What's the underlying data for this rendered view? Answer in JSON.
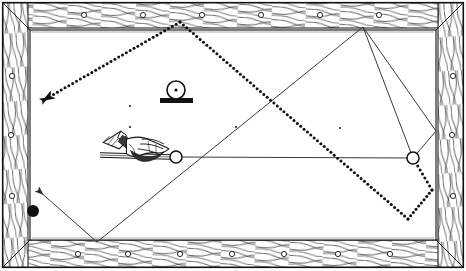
{
  "figure": {
    "type": "billiard-table-diagram",
    "canvas": {
      "width": 466,
      "height": 271
    },
    "colors": {
      "ink": "#111111",
      "rail_wood": "#ffffff",
      "cloth": "#ffffff",
      "ball_black": "#111111",
      "ball_white_fill": "#ffffff",
      "solid_path": "#3a3a3a",
      "dotted_path": "#111111"
    }
  },
  "table": {
    "outer_frame": {
      "x": 3,
      "y": 3,
      "width": 460,
      "height": 264
    },
    "rail_band": {
      "thickness_top": 26,
      "thickness_bottom": 28,
      "thickness_left": 24,
      "thickness_right": 24
    },
    "playing_surface": {
      "x": 30,
      "y": 29,
      "width": 406,
      "height": 212
    },
    "diamond_sights": {
      "top_count": 7,
      "bottom_count": 7,
      "left_count": 3,
      "right_count": 3,
      "marker": "circle-sight"
    }
  },
  "objects": {
    "cue_ball": {
      "name": "cue-ball",
      "x": 176,
      "y": 157,
      "r": 6,
      "fill": "#ffffff",
      "stroke": "#111111"
    },
    "object_ball": {
      "name": "object-ball",
      "x": 413,
      "y": 158,
      "r": 6,
      "fill": "#ffffff",
      "stroke": "#111111"
    },
    "black_ball": {
      "name": "black-ball",
      "x": 33,
      "y": 211,
      "r": 6,
      "fill": "#111111"
    },
    "spotted_ball_on_base": {
      "name": "spotted-ball-on-base",
      "ball": {
        "x": 176,
        "y": 90,
        "r": 9
      },
      "center_dot_r": 1.6,
      "base": {
        "x": 160,
        "y": 98,
        "width": 33,
        "height": 5
      }
    },
    "cue_stick": {
      "name": "cue-stick",
      "shaft_from": {
        "x": 100,
        "y": 155
      },
      "shaft_to": {
        "x": 170,
        "y": 157
      },
      "tip_at_ball": true
    },
    "bridge_hand": {
      "name": "bridge-hand",
      "x": 106,
      "y": 132,
      "width": 62,
      "height": 33,
      "cuff": true
    },
    "table_spots": [
      {
        "name": "cloth-spot",
        "x": 130,
        "y": 106
      },
      {
        "name": "cloth-spot",
        "x": 130,
        "y": 127
      },
      {
        "name": "cloth-spot",
        "x": 236,
        "y": 127
      },
      {
        "name": "cloth-spot",
        "x": 340,
        "y": 128
      }
    ]
  },
  "paths": {
    "solid_trajectory": {
      "name": "solid-trajectory",
      "style": "solid",
      "stroke_width": 1,
      "arrowhead": "end",
      "points": [
        {
          "x": 413,
          "y": 158
        },
        {
          "x": 363,
          "y": 27
        },
        {
          "x": 97,
          "y": 242
        },
        {
          "x": 38,
          "y": 190
        }
      ],
      "segments_label": [
        "object-ball to top rail",
        "top rail to bottom rail",
        "bottom rail to arrow"
      ]
    },
    "solid_aim_line": {
      "name": "solid-aim-line",
      "style": "solid",
      "stroke_width": 1,
      "arrowhead": "none",
      "points": [
        {
          "x": 176,
          "y": 157
        },
        {
          "x": 413,
          "y": 158
        }
      ]
    },
    "solid_right_return": {
      "name": "solid-right-return",
      "style": "solid",
      "stroke_width": 1,
      "arrowhead": "none",
      "points": [
        {
          "x": 363,
          "y": 27
        },
        {
          "x": 436,
          "y": 131
        },
        {
          "x": 413,
          "y": 158
        }
      ]
    },
    "dotted_trajectory": {
      "name": "dotted-trajectory",
      "style": "dotted",
      "dot_radius": 1.5,
      "dot_spacing": 4.4,
      "arrowhead": "end",
      "points": [
        {
          "x": 413,
          "y": 158
        },
        {
          "x": 432,
          "y": 190
        },
        {
          "x": 408,
          "y": 219
        },
        {
          "x": 180,
          "y": 22
        },
        {
          "x": 42,
          "y": 101
        }
      ],
      "segments_label": [
        "object ball to right rail",
        "right rail kick",
        "long diagonal to top rail",
        "top rail to arrow"
      ]
    }
  },
  "annotations": {
    "shot_description": "Cue ball driven into object ball; solid line shows cue-ball path off rails, dotted line shows object-ball path.",
    "legend": [
      {
        "label": "Solid line",
        "meaning": "cue ball path"
      },
      {
        "label": "Dotted line",
        "meaning": "object ball path"
      }
    ]
  }
}
